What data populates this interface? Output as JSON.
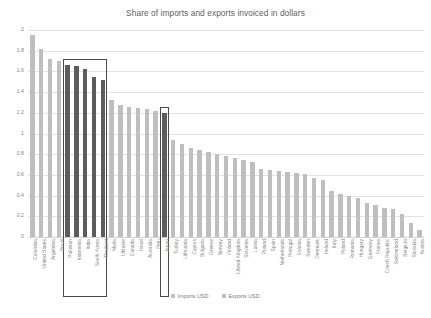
{
  "chart_data": {
    "type": "bar",
    "title": "Share of imports and exports invoiced in dollars",
    "xlabel": "",
    "ylabel": "",
    "ylim": [
      0,
      2
    ],
    "yticks": [
      "0",
      "0.2",
      "0.4",
      "0.6",
      "0.8",
      "1",
      "1.2",
      "1.4",
      "1.6",
      "1.8",
      "2"
    ],
    "grid": true,
    "legend_position": "bottom",
    "legend": [
      {
        "label": "Imports USD",
        "color": "#bfbfbf"
      },
      {
        "label": "Exports USD",
        "color": "#bfbfbf"
      }
    ],
    "categories": [
      "Colombia",
      "United States",
      "Argentina",
      "Brazil",
      "Pakistan",
      "Indonesia",
      "India",
      "South Korea",
      "Thailand",
      "Malta",
      "Ukraine",
      "Canada",
      "Israel",
      "Australia",
      "Peru",
      "Japan",
      "Turkey",
      "Lithuania",
      "Cyprus",
      "Bulgaria",
      "Greece",
      "Norway",
      "Finland",
      "United Kingdom",
      "Slovenia",
      "Latvia",
      "Poland",
      "Spain",
      "Netherlands",
      "Portugal",
      "Estonia",
      "Sweden",
      "Denmark",
      "Ireland",
      "Italy",
      "Poland",
      "Romania",
      "Hungary",
      "Germany",
      "France",
      "Czech Republic",
      "Switzerland",
      "Belgium",
      "Slovakia",
      "Austria"
    ],
    "values": [
      1.95,
      1.82,
      1.72,
      1.7,
      1.66,
      1.65,
      1.62,
      1.55,
      1.52,
      1.32,
      1.28,
      1.26,
      1.25,
      1.24,
      1.22,
      1.2,
      0.94,
      0.9,
      0.86,
      0.84,
      0.82,
      0.8,
      0.78,
      0.76,
      0.74,
      0.72,
      0.66,
      0.65,
      0.64,
      0.63,
      0.62,
      0.61,
      0.57,
      0.55,
      0.44,
      0.42,
      0.4,
      0.38,
      0.33,
      0.31,
      0.28,
      0.27,
      0.22,
      0.14,
      0.07
    ],
    "highlighted": [
      "Pakistan",
      "Indonesia",
      "India",
      "South Korea",
      "Thailand",
      "Japan"
    ],
    "annotations": [
      {
        "name": "emerging-asia-box",
        "from": "Pakistan",
        "to": "Thailand"
      },
      {
        "name": "japan-box",
        "from": "Japan",
        "to": "Japan"
      }
    ]
  }
}
